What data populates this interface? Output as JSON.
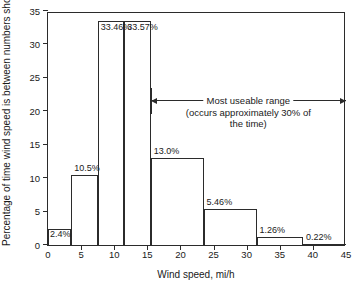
{
  "chart_data": {
    "type": "bar",
    "title": "",
    "xlabel": "Wind speed, mi/h",
    "ylabel": "Percentage of time wind speed is between numbers shown",
    "xlim": [
      0,
      45
    ],
    "ylim": [
      0,
      35
    ],
    "xticks": [
      "0",
      "5",
      "10",
      "15",
      "20",
      "25",
      "30",
      "35",
      "40",
      "45"
    ],
    "xtick_values": [
      0,
      5,
      10,
      15,
      20,
      25,
      30,
      35,
      40,
      45
    ],
    "yticks": [
      "0",
      "5",
      "10",
      "15",
      "20",
      "25",
      "30",
      "35"
    ],
    "ytick_values": [
      0,
      5,
      10,
      15,
      20,
      25,
      30,
      35
    ],
    "grid": false,
    "legend": "none",
    "bin_edges": [
      0,
      3.5,
      7.5,
      11.5,
      15.5,
      19.5,
      23.5,
      31.5,
      38.5,
      45
    ],
    "categories": [
      "0-3.5",
      "3.5-7.5",
      "7.5-11.5",
      "11.5-15.5",
      "15.5-19.5",
      "19.5-23.5",
      "23.5-31.5",
      "31.5-38.5",
      "38.5-45"
    ],
    "values": [
      2.4,
      10.5,
      33.46,
      33.57,
      13.0,
      13.0,
      5.46,
      1.26,
      0.22
    ],
    "bars": [
      {
        "label": "2.4%",
        "value": 2.4,
        "x0": 0,
        "x1": 3.5,
        "label_pos": "inside-left"
      },
      {
        "label": "10.5%",
        "value": 10.5,
        "x0": 3.5,
        "x1": 7.5,
        "label_pos": "above-left"
      },
      {
        "label": "33.46%",
        "value": 33.46,
        "x0": 7.5,
        "x1": 11.5,
        "label_pos": "inside-top"
      },
      {
        "label": "33.57%",
        "value": 33.57,
        "x0": 11.5,
        "x1": 15.5,
        "label_pos": "inside-top"
      },
      {
        "label": "13.0%",
        "value": 13.0,
        "x0": 15.5,
        "x1": 23.5,
        "label_pos": "above-left"
      },
      {
        "label": "5.46%",
        "value": 5.46,
        "x0": 23.5,
        "x1": 31.5,
        "label_pos": "above-left"
      },
      {
        "label": "1.26%",
        "value": 1.26,
        "x0": 31.5,
        "x1": 38.5,
        "label_pos": "above-left"
      },
      {
        "label": "0.22%",
        "value": 0.22,
        "x0": 38.5,
        "x1": 45,
        "label_pos": "above-left"
      }
    ],
    "annotations": [
      {
        "name": "most-useable-range",
        "line1": "Most useable range",
        "line2": "(occurs approximately 30% of",
        "line3": "the time)",
        "x_start": 15.5,
        "x_end": 45,
        "y": 21.5,
        "arrow": "double"
      }
    ]
  }
}
